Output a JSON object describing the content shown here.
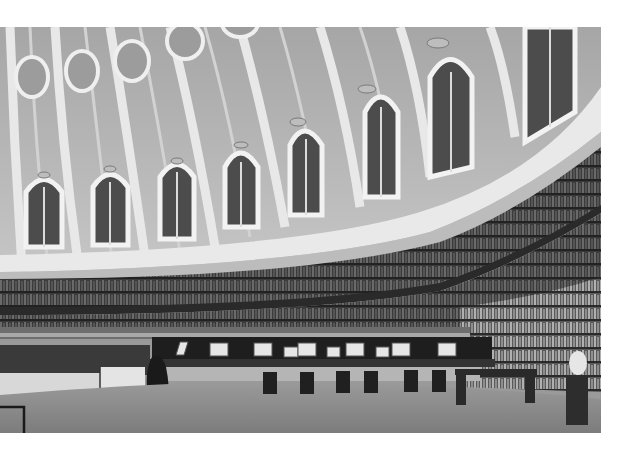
{
  "image": {
    "subject": "Domed circular reading room with curved tiers of bookshelves",
    "style": "black-and-white photograph",
    "alt": "Interior of a circular domed library reading room with arched windows, tiered curved bookcases, and central reading desks with chairs",
    "palette": {
      "background": "#ffffff",
      "dome": "#a8a8a8",
      "ribs": "#e6e6e6",
      "windows": "#4a4a4a",
      "shelves": "#3a3a3a",
      "floor": "#8a8a8a"
    }
  }
}
